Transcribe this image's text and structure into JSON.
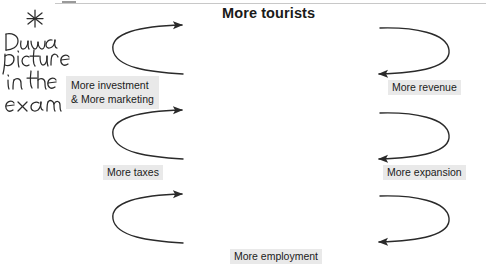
{
  "document": {
    "title": "More tourists",
    "type": "virtuous-circle-flow-diagram"
  },
  "handwritten_annotation": {
    "marker": "asterisk",
    "lines": [
      "Draw a",
      "picture",
      "in the",
      "exam"
    ],
    "full_text": "Draw a picture in the exam",
    "color": "#2b2b2b"
  },
  "nodes": [
    {
      "id": "more-tourists",
      "label": "More tourists",
      "position": "top-center",
      "style": "bold-title",
      "highlighted": false
    },
    {
      "id": "more-revenue",
      "label": "More revenue",
      "position": "right-upper",
      "style": "plain",
      "highlighted": true
    },
    {
      "id": "more-expansion",
      "label": "More expansion",
      "position": "right-lower",
      "style": "plain",
      "highlighted": true
    },
    {
      "id": "more-employment",
      "label": "More employment",
      "position": "bottom-center",
      "style": "plain",
      "highlighted": true
    },
    {
      "id": "more-taxes",
      "label": "More taxes",
      "position": "left-lower",
      "style": "plain",
      "highlighted": true
    },
    {
      "id": "more-investment-marketing",
      "label_line_1": "More investment",
      "label_line_2": "& More marketing",
      "position": "left-upper",
      "style": "two-line",
      "highlighted": true
    }
  ],
  "arrows": [
    {
      "id": "arrow-left-top",
      "direction": "right",
      "side": "left",
      "order": 1
    },
    {
      "id": "arrow-left-middle",
      "direction": "right",
      "side": "left",
      "order": 2
    },
    {
      "id": "arrow-left-bottom",
      "direction": "right",
      "side": "left",
      "order": 3
    },
    {
      "id": "arrow-right-top",
      "direction": "left",
      "side": "right",
      "order": 4
    },
    {
      "id": "arrow-right-middle",
      "direction": "left",
      "side": "right",
      "order": 5
    },
    {
      "id": "arrow-right-bottom",
      "direction": "left",
      "side": "right",
      "order": 6
    }
  ],
  "colors": {
    "ink": "#1b1b1b",
    "arrow": "#2a2a2a",
    "highlight": "#e9e9e9",
    "rule": "#c8c8c8",
    "background": "#ffffff"
  }
}
